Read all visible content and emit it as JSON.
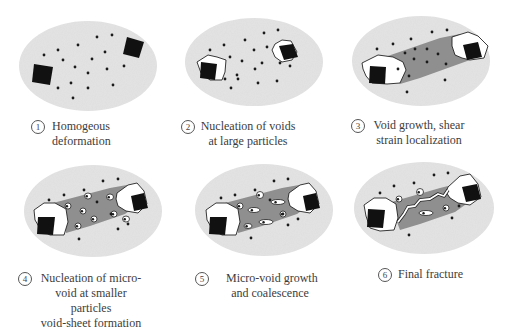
{
  "figure": {
    "colors": {
      "matrix": "#e3e3e3",
      "band": "#8f8f8f",
      "particle": "#111111",
      "void": "#ffffff",
      "dot": "#1a1a1a",
      "outline": "#222222",
      "text": "#3c3c3c"
    },
    "panels": [
      {
        "number": "1",
        "caption_lines": [
          "Homogeous",
          "deformation"
        ],
        "ellipse": {
          "cx": 88,
          "cy": 66,
          "rx": 69,
          "ry": 45
        },
        "band": null,
        "voids": [],
        "particles": [
          {
            "points": "34,64 53,67 50,85 32,82"
          },
          {
            "points": "127,37 144,42 139,58 123,54"
          }
        ],
        "dots": [
          [
            97,
            37
          ],
          [
            112,
            35
          ],
          [
            78,
            45
          ],
          [
            58,
            50
          ],
          [
            105,
            52
          ],
          [
            44,
            55
          ],
          [
            63,
            60
          ],
          [
            92,
            59
          ],
          [
            75,
            67
          ],
          [
            107,
            69
          ],
          [
            124,
            66
          ],
          [
            88,
            73
          ],
          [
            71,
            83
          ],
          [
            58,
            88
          ],
          [
            88,
            88
          ],
          [
            113,
            85
          ],
          [
            73,
            98
          ]
        ],
        "microvoids": []
      },
      {
        "number": "2",
        "caption_lines": [
          "Nucleation of voids",
          "at large particles"
        ],
        "ellipse": {
          "cx": 254,
          "cy": 62,
          "rx": 69,
          "ry": 44
        },
        "band": null,
        "voids": [
          {
            "points": "197,62 208,55 217,57 226,60 225,72 222,80 210,80 201,73"
          },
          {
            "points": "275,44 282,40 291,41 297,52 292,60 282,62 275,57 272,50"
          }
        ],
        "particles": [
          {
            "points": "201,62 217,64 215,80 200,78"
          },
          {
            "points": "279,46 293,44 298,57 284,60"
          }
        ],
        "dots": [
          [
            264,
            33
          ],
          [
            278,
            30
          ],
          [
            245,
            40
          ],
          [
            224,
            45
          ],
          [
            210,
            50
          ],
          [
            254,
            50
          ],
          [
            267,
            47
          ],
          [
            230,
            57
          ],
          [
            242,
            61
          ],
          [
            262,
            63
          ],
          [
            280,
            63
          ],
          [
            290,
            66
          ],
          [
            255,
            69
          ],
          [
            237,
            75
          ],
          [
            225,
            79
          ],
          [
            238,
            79
          ],
          [
            231,
            88
          ],
          [
            258,
            83
          ],
          [
            277,
            81
          ]
        ],
        "microvoids": []
      },
      {
        "number": "3",
        "caption_lines": [
          "Void growth, shear",
          "strain localization"
        ],
        "ellipse": {
          "cx": 421,
          "cy": 61,
          "rx": 69,
          "ry": 45
        },
        "band": {
          "points": "382,58 440,38 460,34 474,50 470,60 420,78 400,84 396,70"
        },
        "voids": [
          {
            "points": "362,63 378,55 393,57 403,62 406,70 400,83 387,84 372,83 366,76 363,69"
          },
          {
            "points": "452,37 468,32 478,36 488,46 484,58 470,60 462,58 455,55 452,46"
          }
        ],
        "particles": [
          {
            "points": "370,66 386,67 385,84 369,83"
          },
          {
            "points": "463,45 478,42 482,57 467,60"
          }
        ],
        "dots": [
          [
            432,
            32
          ],
          [
            447,
            30
          ],
          [
            411,
            39
          ],
          [
            393,
            44
          ],
          [
            377,
            49
          ],
          [
            415,
            49
          ],
          [
            427,
            49
          ],
          [
            438,
            54
          ],
          [
            405,
            53
          ],
          [
            427,
            62
          ],
          [
            414,
            59
          ],
          [
            446,
            64
          ],
          [
            398,
            69
          ],
          [
            409,
            76
          ],
          [
            445,
            80
          ],
          [
            407,
            92
          ]
        ],
        "microvoids": []
      },
      {
        "number": "4",
        "caption_lines": [
          "Nucleation of micro-",
          "void at smaller",
          "particles",
          "void-sheet formation"
        ],
        "ellipse": {
          "cx": 93,
          "cy": 211,
          "rx": 69,
          "ry": 46
        },
        "band": {
          "points": "53,203 110,188 127,185 140,203 125,214 90,226 66,233 62,214"
        },
        "voids": [
          {
            "points": "34,210 44,203 55,203 66,209 68,222 64,235 50,235 41,230 35,220"
          },
          {
            "points": "117,193 128,185 137,183 144,191 147,204 138,213 126,211 118,206 116,199"
          }
        ],
        "particles": [
          {
            "points": "38,217 55,217 53,235 37,234"
          },
          {
            "points": "131,196 144,193 148,208 134,211"
          }
        ],
        "dots": [
          [
            103,
            181
          ],
          [
            118,
            179
          ],
          [
            84,
            190
          ],
          [
            64,
            195
          ],
          [
            49,
            200
          ],
          [
            128,
            224
          ],
          [
            118,
            229
          ],
          [
            79,
            239
          ],
          [
            97,
            202
          ],
          [
            111,
            214
          ]
        ],
        "microvoids": [
          {
            "cx": 88,
            "cy": 196,
            "rx": 3.5,
            "ry": 3
          },
          {
            "cx": 110,
            "cy": 197,
            "rx": 3.5,
            "ry": 3
          },
          {
            "cx": 68,
            "cy": 206,
            "rx": 3,
            "ry": 3
          },
          {
            "cx": 83,
            "cy": 211,
            "rx": 3,
            "ry": 3
          },
          {
            "cx": 94,
            "cy": 219,
            "rx": 3,
            "ry": 3
          },
          {
            "cx": 78,
            "cy": 226,
            "rx": 3,
            "ry": 3
          },
          {
            "cx": 114,
            "cy": 214,
            "rx": 3,
            "ry": 3
          },
          {
            "cx": 126,
            "cy": 219,
            "rx": 3.5,
            "ry": 3
          }
        ]
      },
      {
        "number": "5",
        "caption_lines": [
          "Micro-void growth",
          "and coalescence"
        ],
        "ellipse": {
          "cx": 264,
          "cy": 210,
          "rx": 69,
          "ry": 46
        },
        "band": {
          "points": "225,203 282,188 299,185 312,203 297,214 262,226 238,233 234,214"
        },
        "voids": [
          {
            "points": "206,210 216,203 227,203 238,209 240,222 236,235 222,235 213,230 207,220"
          },
          {
            "points": "289,193 300,185 309,183 316,191 319,204 310,213 298,211 290,206 288,199"
          }
        ],
        "particles": [
          {
            "points": "210,217 227,217 225,235 209,234"
          },
          {
            "points": "303,196 316,193 320,208 306,211"
          }
        ],
        "dots": [
          [
            274,
            181
          ],
          [
            288,
            179
          ],
          [
            255,
            190
          ],
          [
            235,
            195
          ],
          [
            221,
            198
          ],
          [
            298,
            219
          ],
          [
            288,
            225
          ],
          [
            251,
            238
          ],
          [
            270,
            200
          ],
          [
            283,
            214
          ]
        ],
        "microvoids": [
          {
            "cx": 260,
            "cy": 195,
            "rx": 3.5,
            "ry": 3.5
          },
          {
            "cx": 278,
            "cy": 202,
            "rx": 7,
            "ry": 2.5
          },
          {
            "cx": 240,
            "cy": 206,
            "rx": 3,
            "ry": 3
          },
          {
            "cx": 254,
            "cy": 210,
            "rx": 6,
            "ry": 2.5
          },
          {
            "cx": 266,
            "cy": 222,
            "rx": 7,
            "ry": 2.5
          },
          {
            "cx": 248,
            "cy": 226,
            "rx": 4,
            "ry": 2.5
          },
          {
            "cx": 283,
            "cy": 214,
            "rx": 3,
            "ry": 3
          }
        ]
      },
      {
        "number": "6",
        "caption_lines": [
          "Final fracture"
        ],
        "ellipse": {
          "cx": 424,
          "cy": 208,
          "rx": 70,
          "ry": 46
        },
        "band": {
          "points": "388,203 440,188 460,183 472,200 455,212 420,224 400,230 394,214"
        },
        "voids": [
          {
            "points": "364,205 374,198 386,198 396,204 398,218 394,230 380,231 370,228 366,216"
          },
          {
            "points": "448,187 460,176 470,174 478,184 481,197 470,205 458,203 450,198 446,192"
          }
        ],
        "particles": [
          {
            "points": "368,209 385,210 383,228 367,227"
          },
          {
            "points": "462,187 477,184 481,199 466,202"
          }
        ],
        "dots": [
          [
            434,
            175
          ],
          [
            448,
            173
          ],
          [
            414,
            183
          ],
          [
            394,
            186
          ],
          [
            380,
            193
          ],
          [
            459,
            206
          ],
          [
            452,
            218
          ],
          [
            409,
            235
          ]
        ],
        "microvoids": [
          {
            "cx": 420,
            "cy": 192,
            "rx": 3.5,
            "ry": 3.5
          },
          {
            "cx": 399,
            "cy": 199,
            "rx": 3,
            "ry": 3
          },
          {
            "cx": 426,
            "cy": 213,
            "rx": 7,
            "ry": 2.5
          },
          {
            "cx": 446,
            "cy": 208,
            "rx": 3,
            "ry": 3
          }
        ],
        "crack": "M398,222 L404,214 L408,207 L415,206 L420,200 L430,199 L438,194 L444,196 L448,190"
      }
    ],
    "captions": [
      {
        "number": "1",
        "num_x": 31,
        "num_y": 120,
        "text_x": 52,
        "text_y": 119,
        "width": 58
      },
      {
        "number": "2",
        "num_x": 181,
        "num_y": 120,
        "text_x": 200,
        "text_y": 119,
        "width": 96
      },
      {
        "number": "3",
        "num_x": 351,
        "num_y": 119,
        "text_x": 373,
        "text_y": 118,
        "width": 92
      },
      {
        "number": "4",
        "num_x": 18,
        "num_y": 272,
        "text_x": 40,
        "text_y": 271,
        "width": 102
      },
      {
        "number": "5",
        "num_x": 195,
        "num_y": 272,
        "text_x": 226,
        "text_y": 271,
        "width": 88
      },
      {
        "number": "6",
        "num_x": 378,
        "num_y": 268,
        "text_x": 398,
        "text_y": 267,
        "width": 66
      }
    ]
  }
}
